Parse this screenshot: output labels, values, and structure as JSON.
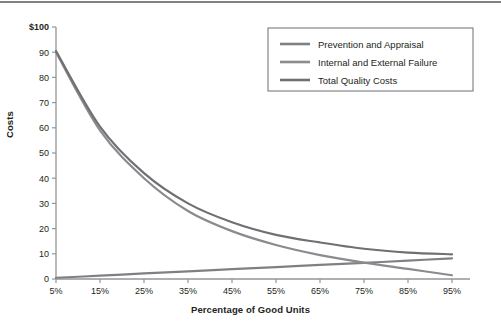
{
  "chart_data": {
    "type": "line",
    "title": "",
    "xlabel": "Percentage of Good Units",
    "ylabel": "Costs",
    "x": [
      "5%",
      "15%",
      "25%",
      "35%",
      "45%",
      "55%",
      "65%",
      "75%",
      "85%",
      "95%"
    ],
    "xtick_labels": [
      "5%",
      "15%",
      "25%",
      "35%",
      "45%",
      "55%",
      "65%",
      "75%",
      "85%",
      "95%"
    ],
    "ytick_labels": [
      "0",
      "10",
      "20",
      "30",
      "40",
      "50",
      "60",
      "70",
      "80",
      "90",
      "$100"
    ],
    "ylim": [
      0,
      100
    ],
    "grid": false,
    "legend_position": "top-right",
    "series": [
      {
        "name": "Prevention and Appraisal",
        "color": "#7f8083",
        "values": [
          0.5,
          1.3,
          2.2,
          3.0,
          3.9,
          4.7,
          5.6,
          6.4,
          7.3,
          8.2
        ]
      },
      {
        "name": "Internal and External Failure",
        "color": "#8a8b8e",
        "values": [
          90.0,
          59.0,
          40.0,
          27.0,
          19.0,
          13.5,
          9.5,
          6.5,
          4.0,
          1.5
        ]
      },
      {
        "name": "Total Quality Costs",
        "color": "#6f7073",
        "values": [
          90.5,
          60.5,
          42.0,
          30.0,
          22.5,
          17.5,
          14.5,
          12.0,
          10.5,
          9.8
        ]
      }
    ]
  },
  "legend": {
    "items": [
      {
        "label": "Prevention and Appraisal",
        "color": "#7f8083"
      },
      {
        "label": "Internal and External Failure",
        "color": "#8a8b8e"
      },
      {
        "label": "Total Quality Costs",
        "color": "#6f7073"
      }
    ]
  },
  "axes": {
    "y_title": "Costs",
    "x_title": "Percentage of Good Units",
    "y_ticks": [
      "$100",
      "90",
      "80",
      "70",
      "60",
      "50",
      "40",
      "30",
      "20",
      "10",
      "0"
    ],
    "x_ticks": [
      "5%",
      "15%",
      "25%",
      "35%",
      "45%",
      "55%",
      "65%",
      "75%",
      "85%",
      "95%"
    ]
  }
}
